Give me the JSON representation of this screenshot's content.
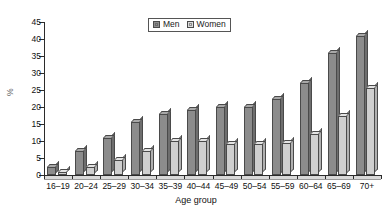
{
  "chart_data": {
    "type": "bar",
    "title": "",
    "xlabel": "Age group",
    "ylabel": "%",
    "categories": [
      "16–19",
      "20–24",
      "25–29",
      "30–34",
      "35–39",
      "40–44",
      "45–49",
      "50–54",
      "55–59",
      "60–64",
      "65–69",
      "70+"
    ],
    "series": [
      {
        "name": "Men",
        "color": "#8c8c8c",
        "values": [
          2.5,
          7,
          11,
          15.5,
          18,
          19,
          20,
          20,
          22.5,
          27,
          36,
          41
        ]
      },
      {
        "name": "Women",
        "color": "#cfcfcf",
        "values": [
          1,
          2.5,
          4.5,
          7,
          10,
          10,
          9,
          9,
          9.5,
          12,
          17.5,
          25.5
        ]
      }
    ],
    "ylim": [
      0,
      45
    ],
    "yticks": [
      0,
      5,
      10,
      15,
      20,
      25,
      30,
      35,
      40,
      45
    ],
    "ytick_labels": [
      "0",
      "5",
      "10",
      "15",
      "20",
      "25",
      "30",
      "35",
      "40",
      "45"
    ],
    "grid": false,
    "legend_position": "top-center"
  },
  "legend": {
    "items": [
      {
        "label": "Men"
      },
      {
        "label": "Women"
      }
    ]
  },
  "axes": {
    "x_title": "Age group",
    "y_title": "%"
  }
}
